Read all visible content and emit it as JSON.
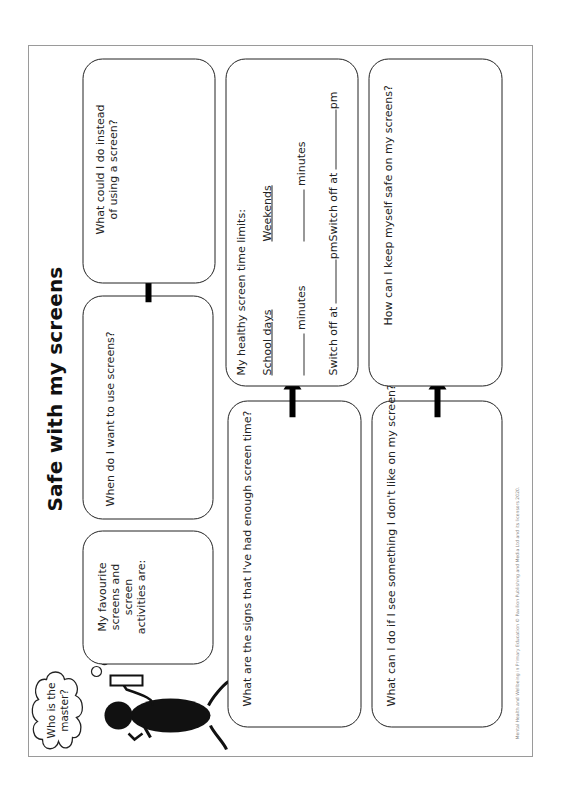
{
  "worksheet": {
    "title": "Safe with my screens",
    "thought_bubble": {
      "line1": "Who is the",
      "line2": "master?"
    },
    "boxes": {
      "favourite": {
        "line1": "My favourite",
        "line2": "screens and screen",
        "line3": "activities are:"
      },
      "when_use": {
        "text": "When do I want to use screens?"
      },
      "instead": {
        "line1": "What could I do instead",
        "line2": "of using a screen?"
      },
      "signs": {
        "text": "What are the signs that I've had enough screen time?"
      },
      "limits": {
        "heading": "My healthy screen time limits:",
        "school_days": {
          "label": "School days",
          "minutes_label": "minutes",
          "switch_off_label": "Switch off at",
          "pm_label": "pm"
        },
        "weekends": {
          "label": "Weekends",
          "minutes_label": "minutes",
          "switch_off_label": "Switch off at",
          "pm_label": "pm"
        }
      },
      "see_something": {
        "text": "What can I do if I see something I don't like on my screen?"
      },
      "keep_safe": {
        "text": "How can I keep myself safe on my screens?"
      }
    },
    "footer": "Mental Health and Wellbeing in Primary Education © Pavilion Publishing and Media Ltd and its licensors 2020.",
    "icons": [
      "stick-figure-icon",
      "thought-cloud-icon",
      "arrow-icon"
    ],
    "colors": {
      "ink": "#222222",
      "frame": "#9a9a9a",
      "paper": "#ffffff",
      "footer_text": "#888888"
    }
  }
}
